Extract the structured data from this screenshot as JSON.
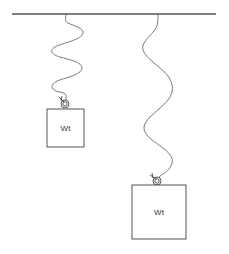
{
  "diagram": {
    "ceiling": {
      "x1": 12,
      "y1": 14,
      "x2": 216,
      "y2": 14
    },
    "masses": [
      {
        "id": "small",
        "label": "Wt",
        "box": {
          "x": 47,
          "y": 109,
          "width": 37,
          "height": 38
        },
        "hook": {
          "cx": 65,
          "cy": 104,
          "r": 4
        }
      },
      {
        "id": "large",
        "label": "Wt",
        "box": {
          "x": 132,
          "y": 185,
          "width": 54,
          "height": 54
        },
        "hook": {
          "cx": 157,
          "cy": 181,
          "r": 4
        }
      }
    ],
    "springs": [
      {
        "id": "left-spring",
        "attached_to": "small"
      },
      {
        "id": "right-spring",
        "attached_to": "large"
      }
    ]
  }
}
